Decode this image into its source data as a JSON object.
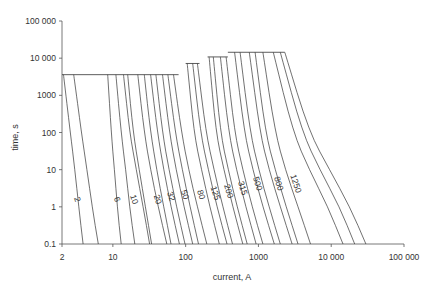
{
  "chart_data": {
    "type": "line",
    "title": "",
    "xlabel": "current, A",
    "ylabel": "time, s",
    "xscale": "log",
    "yscale": "log",
    "xlim": [
      2,
      100000
    ],
    "ylim": [
      0.1,
      100000
    ],
    "x_ticks": [
      {
        "value": 2,
        "label": "2"
      },
      {
        "value": 10,
        "label": "10"
      },
      {
        "value": 100,
        "label": "100"
      },
      {
        "value": 1000,
        "label": "1000"
      },
      {
        "value": 10000,
        "label": "10 000"
      },
      {
        "value": 100000,
        "label": "100 000"
      }
    ],
    "y_ticks": [
      {
        "value": 0.1,
        "label": "0.1"
      },
      {
        "value": 1,
        "label": "1"
      },
      {
        "value": 10,
        "label": "10"
      },
      {
        "value": 100,
        "label": "100"
      },
      {
        "value": 1000,
        "label": "1000"
      },
      {
        "value": 10000,
        "label": "10 000"
      },
      {
        "value": 100000,
        "label": "100 000"
      }
    ],
    "grid": false,
    "legend": "none",
    "series": [
      {
        "name": "2",
        "labeled": true,
        "plateau_s": 3600,
        "points": [
          [
            2.1,
            3600
          ],
          [
            2.6,
            100
          ],
          [
            3.0,
            10
          ],
          [
            3.4,
            1
          ],
          [
            3.9,
            0.1
          ]
        ]
      },
      {
        "name": "2b",
        "labeled": false,
        "plateau_s": 3600,
        "points": [
          [
            2.9,
            3600
          ],
          [
            3.7,
            100
          ],
          [
            4.4,
            10
          ],
          [
            5.2,
            1
          ],
          [
            6.3,
            0.1
          ]
        ]
      },
      {
        "name": "6",
        "labeled": true,
        "plateau_s": 3600,
        "points": [
          [
            8.5,
            3600
          ],
          [
            9.5,
            100
          ],
          [
            10.5,
            10
          ],
          [
            11.5,
            1
          ],
          [
            13,
            0.1
          ]
        ]
      },
      {
        "name": "6b",
        "labeled": false,
        "plateau_s": 3600,
        "points": [
          [
            11,
            3600
          ],
          [
            13,
            100
          ],
          [
            15,
            10
          ],
          [
            17,
            1
          ],
          [
            20,
            0.1
          ]
        ]
      },
      {
        "name": "10",
        "labeled": true,
        "plateau_s": 3600,
        "points": [
          [
            14,
            3600
          ],
          [
            17,
            100
          ],
          [
            21,
            10
          ],
          [
            26,
            1
          ],
          [
            32,
            0.1
          ]
        ]
      },
      {
        "name": "10b",
        "labeled": false,
        "plateau_s": 3600,
        "points": [
          [
            16,
            3600
          ],
          [
            19,
            100
          ],
          [
            23,
            10
          ],
          [
            28,
            1
          ],
          [
            34,
            0.1
          ]
        ]
      },
      {
        "name": "20",
        "labeled": true,
        "plateau_s": 3600,
        "points": [
          [
            22,
            3600
          ],
          [
            27,
            100
          ],
          [
            33,
            10
          ],
          [
            42,
            1
          ],
          [
            55,
            0.1
          ]
        ]
      },
      {
        "name": "20b",
        "labeled": false,
        "plateau_s": 3600,
        "points": [
          [
            27,
            3600
          ],
          [
            33,
            100
          ],
          [
            40,
            10
          ],
          [
            50,
            1
          ],
          [
            63,
            0.1
          ]
        ]
      },
      {
        "name": "32",
        "labeled": true,
        "plateau_s": 3600,
        "points": [
          [
            33,
            3600
          ],
          [
            41,
            100
          ],
          [
            50,
            10
          ],
          [
            63,
            1
          ],
          [
            82,
            0.1
          ]
        ]
      },
      {
        "name": "32b",
        "labeled": false,
        "plateau_s": 3600,
        "points": [
          [
            39,
            3600
          ],
          [
            48,
            100
          ],
          [
            59,
            10
          ],
          [
            75,
            1
          ],
          [
            98,
            0.1
          ]
        ]
      },
      {
        "name": "50",
        "labeled": true,
        "plateau_s": 3600,
        "points": [
          [
            48,
            3600
          ],
          [
            60,
            100
          ],
          [
            74,
            10
          ],
          [
            95,
            1
          ],
          [
            125,
            0.1
          ]
        ]
      },
      {
        "name": "50b",
        "labeled": false,
        "plateau_s": 3600,
        "points": [
          [
            57,
            3600
          ],
          [
            72,
            100
          ],
          [
            90,
            10
          ],
          [
            115,
            1
          ],
          [
            150,
            0.1
          ]
        ]
      },
      {
        "name": "80",
        "labeled": true,
        "plateau_s": 3600,
        "points": [
          [
            68,
            3600
          ],
          [
            88,
            100
          ],
          [
            110,
            10
          ],
          [
            145,
            1
          ],
          [
            195,
            0.1
          ]
        ]
      },
      {
        "name": "80b",
        "labeled": false,
        "plateau_s": 7200,
        "points": [
          [
            105,
            7200
          ],
          [
            130,
            100
          ],
          [
            165,
            10
          ],
          [
            215,
            1
          ],
          [
            290,
            0.1
          ]
        ]
      },
      {
        "name": "125",
        "labeled": true,
        "plateau_s": 7200,
        "points": [
          [
            125,
            7200
          ],
          [
            160,
            100
          ],
          [
            205,
            10
          ],
          [
            270,
            1
          ],
          [
            370,
            0.1
          ]
        ]
      },
      {
        "name": "125b",
        "labeled": false,
        "plateau_s": 7200,
        "points": [
          [
            145,
            7200
          ],
          [
            190,
            100
          ],
          [
            245,
            10
          ],
          [
            325,
            1
          ],
          [
            440,
            0.1
          ]
        ]
      },
      {
        "name": "200",
        "labeled": true,
        "plateau_s": 10800,
        "points": [
          [
            210,
            10800
          ],
          [
            260,
            100
          ],
          [
            335,
            10
          ],
          [
            445,
            1
          ],
          [
            610,
            0.1
          ]
        ]
      },
      {
        "name": "200b",
        "labeled": false,
        "plateau_s": 10800,
        "points": [
          [
            240,
            10800
          ],
          [
            300,
            100
          ],
          [
            385,
            10
          ],
          [
            510,
            1
          ],
          [
            700,
            0.1
          ]
        ]
      },
      {
        "name": "315",
        "labeled": true,
        "plateau_s": 10800,
        "points": [
          [
            300,
            10800
          ],
          [
            390,
            100
          ],
          [
            500,
            10
          ],
          [
            670,
            1
          ],
          [
            930,
            0.1
          ]
        ]
      },
      {
        "name": "315b",
        "labeled": false,
        "plateau_s": 10800,
        "points": [
          [
            360,
            10800
          ],
          [
            470,
            100
          ],
          [
            610,
            10
          ],
          [
            820,
            1
          ],
          [
            1150,
            0.1
          ]
        ]
      },
      {
        "name": "500",
        "labeled": true,
        "plateau_s": 14400,
        "points": [
          [
            470,
            14400
          ],
          [
            640,
            100
          ],
          [
            840,
            10
          ],
          [
            1150,
            1
          ],
          [
            1650,
            0.1
          ]
        ]
      },
      {
        "name": "500b",
        "labeled": false,
        "plateau_s": 14400,
        "points": [
          [
            560,
            14400
          ],
          [
            770,
            100
          ],
          [
            1010,
            10
          ],
          [
            1400,
            1
          ],
          [
            2000,
            0.1
          ]
        ]
      },
      {
        "name": "800",
        "labeled": true,
        "plateau_s": 14400,
        "points": [
          [
            750,
            14400
          ],
          [
            1050,
            100
          ],
          [
            1400,
            10
          ],
          [
            2000,
            1
          ],
          [
            2900,
            0.1
          ]
        ]
      },
      {
        "name": "800b",
        "labeled": false,
        "plateau_s": 14400,
        "points": [
          [
            900,
            14400
          ],
          [
            1250,
            100
          ],
          [
            1700,
            10
          ],
          [
            2400,
            1
          ],
          [
            3500,
            0.1
          ]
        ]
      },
      {
        "name": "1250",
        "labeled": true,
        "plateau_s": 14400,
        "points": [
          [
            1150,
            14400
          ],
          [
            1700,
            100
          ],
          [
            2350,
            10
          ],
          [
            3500,
            1
          ],
          [
            5200,
            0.1
          ]
        ]
      },
      {
        "name": "1250b",
        "labeled": false,
        "plateau_s": 14400,
        "points": [
          [
            1600,
            14400
          ],
          [
            3000,
            100
          ],
          [
            5000,
            10
          ],
          [
            9000,
            1
          ],
          [
            14500,
            0.1
          ]
        ]
      },
      {
        "name": "1250c",
        "labeled": false,
        "plateau_s": 14400,
        "points": [
          [
            2000,
            14400
          ],
          [
            4000,
            100
          ],
          [
            7000,
            10
          ],
          [
            13000,
            1
          ],
          [
            21000,
            0.1
          ]
        ]
      },
      {
        "name": "1250d",
        "labeled": false,
        "plateau_s": 14400,
        "points": [
          [
            2300,
            14400
          ],
          [
            5000,
            100
          ],
          [
            9500,
            10
          ],
          [
            18000,
            1
          ],
          [
            30000,
            0.1
          ]
        ]
      }
    ],
    "plateaus": [
      {
        "time_s": 3600,
        "x_from": 2,
        "x_to": 80
      },
      {
        "time_s": 7200,
        "x_from": 100,
        "x_to": 155
      },
      {
        "time_s": 10800,
        "x_from": 200,
        "x_to": 380
      },
      {
        "time_s": 14400,
        "x_from": 380,
        "x_to": 2300
      }
    ],
    "curve_labels": [
      {
        "text": "2",
        "x": 3.0,
        "y": 1.5
      },
      {
        "text": "6",
        "x": 10.5,
        "y": 1.5
      },
      {
        "text": "10",
        "x": 18,
        "y": 1.5
      },
      {
        "text": "20",
        "x": 38,
        "y": 1.5
      },
      {
        "text": "32",
        "x": 58,
        "y": 1.8
      },
      {
        "text": "50",
        "x": 90,
        "y": 2.0
      },
      {
        "text": "80",
        "x": 150,
        "y": 2.0
      },
      {
        "text": "125",
        "x": 235,
        "y": 2.2
      },
      {
        "text": "200",
        "x": 360,
        "y": 2.5
      },
      {
        "text": "315",
        "x": 560,
        "y": 3.0
      },
      {
        "text": "500",
        "x": 900,
        "y": 4.0
      },
      {
        "text": "800",
        "x": 1750,
        "y": 4.0
      },
      {
        "text": "1250",
        "x": 3000,
        "y": 4.0
      }
    ]
  }
}
